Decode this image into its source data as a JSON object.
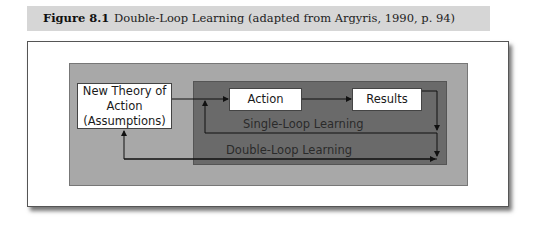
{
  "caption": {
    "figure_number": "Figure 8.1",
    "title": "Double-Loop Learning (adapted from Argyris, 1990, p. 94)"
  },
  "diagram": {
    "nodes": {
      "theory": "New Theory of Action (Assumptions)",
      "theory_lines": [
        "New Theory of",
        "Action",
        "(Assumptions)"
      ],
      "action": "Action",
      "results": "Results"
    },
    "loops": {
      "single": "Single-Loop Learning",
      "double": "Double-Loop Learning"
    },
    "edges": [
      {
        "from": "New Theory of Action (Assumptions)",
        "to": "Action"
      },
      {
        "from": "Action",
        "to": "Results"
      },
      {
        "from": "Results",
        "to": "Action",
        "label": "Single-Loop Learning"
      },
      {
        "from": "Results",
        "to": "New Theory of Action (Assumptions)",
        "label": "Double-Loop Learning"
      }
    ],
    "colors": {
      "caption_bg": "#d6d6d6",
      "outer_box": "#a8a8a8",
      "inner_box": "#6a6a6a",
      "node_bg": "#ffffff"
    }
  }
}
